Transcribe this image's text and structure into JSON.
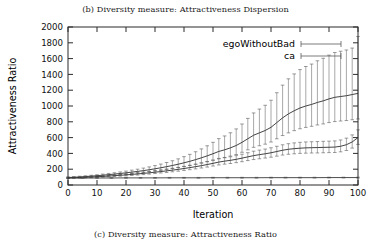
{
  "figure": {
    "caption_top": "(b) Diversity measure: Attractiveness Dispersion",
    "caption_bottom": "(c) Diversity measure: Attractiveness Ratio"
  },
  "chart_data": {
    "type": "line",
    "title": "",
    "xlabel": "Iteration",
    "ylabel": "Attractiveness Ratio",
    "xlim": [
      0,
      100
    ],
    "ylim": [
      0,
      2000
    ],
    "xticks": [
      0,
      10,
      20,
      30,
      40,
      50,
      60,
      70,
      80,
      90,
      100
    ],
    "yticks": [
      0,
      200,
      400,
      600,
      800,
      1000,
      1200,
      1400,
      1600,
      1800,
      2000
    ],
    "grid": false,
    "legend_position": "upper-right",
    "error_bars": "vertical-with-caps",
    "series": [
      {
        "name": "egoWithoutBad",
        "color": "#2f2f2f",
        "x": [
          0,
          2,
          4,
          6,
          8,
          10,
          12,
          14,
          16,
          18,
          20,
          22,
          24,
          26,
          28,
          30,
          32,
          34,
          36,
          38,
          40,
          42,
          44,
          46,
          48,
          50,
          52,
          54,
          56,
          58,
          60,
          62,
          64,
          66,
          68,
          70,
          72,
          74,
          76,
          78,
          80,
          82,
          84,
          86,
          88,
          90,
          92,
          94,
          96,
          98,
          100
        ],
        "values": [
          95,
          98,
          102,
          107,
          112,
          118,
          124,
          131,
          138,
          146,
          154,
          163,
          172,
          182,
          193,
          205,
          218,
          232,
          247,
          263,
          281,
          300,
          321,
          344,
          369,
          396,
          425,
          445,
          470,
          500,
          540,
          585,
          630,
          660,
          690,
          730,
          790,
          850,
          900,
          940,
          975,
          1000,
          1020,
          1045,
          1065,
          1090,
          1110,
          1120,
          1130,
          1145,
          1160
        ],
        "err_low": [
          8,
          8,
          9,
          9,
          10,
          11,
          12,
          13,
          14,
          16,
          17,
          19,
          21,
          23,
          25,
          28,
          31,
          34,
          38,
          42,
          47,
          52,
          58,
          64,
          72,
          80,
          89,
          96,
          104,
          114,
          126,
          140,
          153,
          163,
          173,
          186,
          205,
          224,
          240,
          252,
          263,
          271,
          277,
          285,
          292,
          300,
          307,
          310,
          314,
          319,
          324
        ],
        "err_high": [
          8,
          8,
          9,
          10,
          11,
          12,
          14,
          15,
          17,
          19,
          22,
          25,
          28,
          32,
          36,
          41,
          47,
          53,
          60,
          68,
          78,
          88,
          100,
          113,
          128,
          144,
          162,
          176,
          191,
          210,
          232,
          258,
          282,
          301,
          319,
          343,
          378,
          414,
          444,
          466,
          486,
          500,
          511,
          527,
          539,
          554,
          567,
          573,
          579,
          588,
          720
        ]
      },
      {
        "name": "egoWithoutBad-lower",
        "color": "#3a3a3a",
        "x": [
          0,
          2,
          4,
          6,
          8,
          10,
          12,
          14,
          16,
          18,
          20,
          22,
          24,
          26,
          28,
          30,
          32,
          34,
          36,
          38,
          40,
          42,
          44,
          46,
          48,
          50,
          52,
          54,
          56,
          58,
          60,
          62,
          64,
          66,
          68,
          70,
          72,
          74,
          76,
          78,
          80,
          82,
          84,
          86,
          88,
          90,
          92,
          94,
          96,
          98,
          100
        ],
        "values": [
          90,
          92,
          95,
          98,
          101,
          105,
          109,
          113,
          118,
          123,
          128,
          134,
          140,
          147,
          154,
          162,
          170,
          179,
          188,
          198,
          209,
          220,
          232,
          245,
          259,
          274,
          290,
          302,
          312,
          325,
          340,
          356,
          372,
          384,
          395,
          408,
          424,
          440,
          452,
          460,
          466,
          470,
          472,
          474,
          476,
          478,
          480,
          490,
          510,
          545,
          600
        ],
        "err_low": [
          6,
          6,
          7,
          7,
          8,
          8,
          9,
          9,
          10,
          11,
          12,
          13,
          14,
          15,
          16,
          17,
          18,
          20,
          21,
          23,
          25,
          26,
          28,
          30,
          32,
          34,
          36,
          38,
          40,
          42,
          45,
          47,
          50,
          52,
          54,
          56,
          59,
          61,
          63,
          65,
          66,
          67,
          67,
          68,
          68,
          68,
          69,
          70,
          73,
          78,
          86
        ],
        "err_high": [
          6,
          6,
          7,
          7,
          8,
          9,
          9,
          10,
          11,
          12,
          13,
          14,
          15,
          16,
          18,
          19,
          20,
          22,
          24,
          25,
          27,
          29,
          31,
          33,
          36,
          38,
          41,
          43,
          45,
          47,
          50,
          53,
          56,
          58,
          60,
          63,
          66,
          69,
          71,
          73,
          74,
          75,
          76,
          76,
          77,
          77,
          78,
          80,
          83,
          89,
          98
        ]
      },
      {
        "name": "ca",
        "color": "#3a3a3a",
        "x": [
          0,
          5,
          10,
          15,
          20,
          25,
          30,
          35,
          40,
          45,
          50,
          55,
          60,
          65,
          70,
          75,
          80,
          85,
          90,
          95,
          100
        ],
        "values": [
          88,
          88,
          89,
          89,
          90,
          90,
          90,
          91,
          91,
          91,
          92,
          92,
          92,
          92,
          93,
          93,
          93,
          93,
          94,
          94,
          94
        ],
        "err_low": [
          5,
          5,
          5,
          5,
          5,
          5,
          5,
          5,
          5,
          5,
          5,
          5,
          5,
          5,
          5,
          5,
          5,
          5,
          5,
          5,
          5
        ],
        "err_high": [
          5,
          5,
          5,
          5,
          5,
          5,
          5,
          5,
          5,
          5,
          5,
          5,
          5,
          5,
          5,
          5,
          5,
          5,
          5,
          5,
          5
        ]
      }
    ],
    "legend": [
      {
        "label": "egoWithoutBad",
        "marker": "errorbar-horizontal"
      },
      {
        "label": "ca",
        "marker": "errorbar-horizontal"
      }
    ]
  }
}
